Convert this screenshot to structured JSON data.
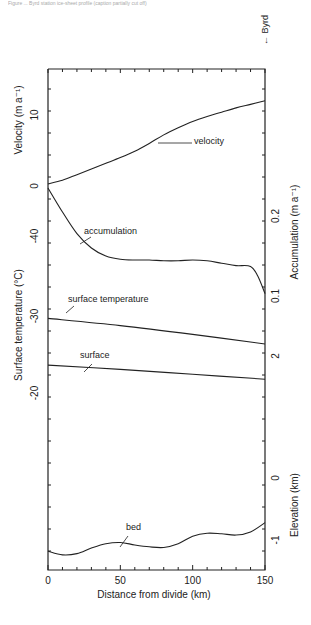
{
  "caption": "Figure ... Byrd station ice-sheet profile (caption partially cut off)",
  "byrd_label": "← Byrd",
  "chart_data": {
    "type": "line",
    "orientation": "rotated 90° (x axis runs along bottom, curves stacked vertically)",
    "xlabel": "Distance from divide (km)",
    "xlim": [
      0,
      150
    ],
    "x_ticks": [
      "0",
      "50",
      "100",
      "150"
    ],
    "axes": {
      "left": [
        {
          "label": "Velocity (m a⁻¹)",
          "ticks": [
            "0",
            "10"
          ]
        },
        {
          "label": "Surface temperature (°C)",
          "ticks": [
            "-40",
            "-30",
            "-20"
          ]
        }
      ],
      "right": [
        {
          "label": "Accumulation (m a⁻¹)",
          "ticks": [
            "0.1",
            "0.2"
          ]
        },
        {
          "label": "Elevation (km)",
          "ticks": [
            "-1",
            "0",
            "2"
          ]
        }
      ]
    },
    "annotation": "← Byrd (at 150 km end)",
    "series": [
      {
        "name": "velocity",
        "unit": "m a⁻¹",
        "x": [
          0,
          10,
          20,
          30,
          40,
          50,
          60,
          70,
          80,
          90,
          100,
          110,
          120,
          130,
          140,
          150
        ],
        "values": [
          0.3,
          0.8,
          1.6,
          2.4,
          3.2,
          4.0,
          4.9,
          6.0,
          7.2,
          8.2,
          9.1,
          9.8,
          10.4,
          11.0,
          11.5,
          12.0
        ]
      },
      {
        "name": "accumulation",
        "unit": "m a⁻¹",
        "x": [
          0,
          10,
          20,
          30,
          40,
          50,
          60,
          70,
          80,
          90,
          100,
          110,
          120,
          130,
          140,
          145,
          150
        ],
        "values": [
          0.235,
          0.205,
          0.178,
          0.16,
          0.15,
          0.146,
          0.145,
          0.145,
          0.144,
          0.144,
          0.145,
          0.144,
          0.141,
          0.138,
          0.137,
          0.125,
          0.103
        ]
      },
      {
        "name": "surface temperature",
        "unit": "°C",
        "x": [
          0,
          50,
          100,
          150
        ],
        "values": [
          -29.7,
          -28.8,
          -27.7,
          -26.5
        ]
      },
      {
        "name": "surface",
        "unit": "km",
        "x": [
          0,
          50,
          100,
          150
        ],
        "values": [
          1.85,
          1.78,
          1.7,
          1.62
        ]
      },
      {
        "name": "bed",
        "unit": "km",
        "x": [
          0,
          10,
          20,
          30,
          40,
          50,
          60,
          70,
          80,
          90,
          100,
          110,
          120,
          130,
          140,
          150
        ],
        "values": [
          -1.18,
          -1.24,
          -1.22,
          -1.13,
          -1.06,
          -1.04,
          -1.08,
          -1.11,
          -1.12,
          -1.06,
          -0.94,
          -0.89,
          -0.9,
          -0.92,
          -0.87,
          -0.72
        ]
      }
    ],
    "grid": false,
    "legend": "inline curve labels with leader lines"
  },
  "labels": {
    "velocity": "velocity",
    "accumulation": "accumulation",
    "surface_temperature": "surface temperature",
    "surface": "surface",
    "bed": "bed"
  }
}
